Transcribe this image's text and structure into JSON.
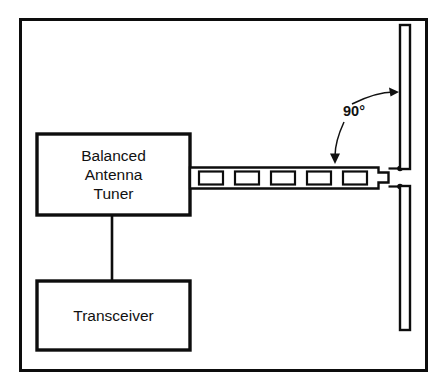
{
  "diagram": {
    "frame": {
      "name": "outer-border"
    },
    "boxes": [
      {
        "id": "balanced-antenna-tuner",
        "lines": [
          "Balanced",
          "Antenna",
          "Tuner"
        ]
      },
      {
        "id": "transceiver",
        "lines": [
          "Transceiver"
        ]
      }
    ],
    "annotations": [
      {
        "id": "right-angle",
        "text": "90°"
      }
    ],
    "feedline": {
      "name": "window-ladder-line",
      "window_count": 5
    },
    "antenna": {
      "name": "vertical-dipole",
      "elements": [
        "upper-element",
        "lower-element"
      ]
    },
    "colors": {
      "ink": "#0d0d0d",
      "paper": "#ffffff"
    }
  }
}
